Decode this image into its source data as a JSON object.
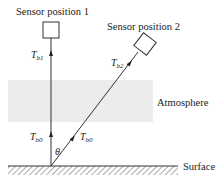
{
  "labels": {
    "sensor1": "Sensor position 1",
    "sensor2": "Sensor position 2",
    "atmosphere": "Atmosphere",
    "surface": "Surface",
    "angle": "θ"
  },
  "symbols": {
    "tb1": {
      "base": "T",
      "sub": "b1"
    },
    "tb2": {
      "base": "T",
      "sub": "b2"
    },
    "tb0_vertical": {
      "base": "T",
      "sub": "b0"
    },
    "tb0_slant": {
      "base": "T",
      "sub": "b0"
    }
  },
  "colors": {
    "atmosphere_fill": "#ececec",
    "line": "#333333"
  }
}
